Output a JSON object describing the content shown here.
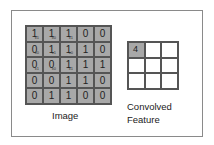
{
  "image": {
    "label": "Image",
    "matrix": [
      [
        "1",
        "1",
        "1",
        "0",
        "0"
      ],
      [
        "0",
        "1",
        "1",
        "1",
        "0"
      ],
      [
        "0",
        "0",
        "1",
        "1",
        "1"
      ],
      [
        "0",
        "0",
        "1",
        "1",
        "0"
      ],
      [
        "0",
        "1",
        "1",
        "0",
        "0"
      ]
    ],
    "kernel_subscripts": [
      [
        "x1",
        "x0",
        "x1"
      ],
      [
        "x0",
        "x1",
        "x0"
      ],
      [
        "x1",
        "x0",
        "x1"
      ]
    ]
  },
  "convolved": {
    "label_line1": "Convolved",
    "label_line2": "Feature",
    "matrix": [
      [
        "4",
        "",
        ""
      ],
      [
        "",
        "",
        ""
      ],
      [
        "",
        "",
        ""
      ]
    ]
  },
  "colors": {
    "cell_fill": "#a8a8a8",
    "grid_line": "#555555",
    "frame": "#8a8a8a"
  }
}
